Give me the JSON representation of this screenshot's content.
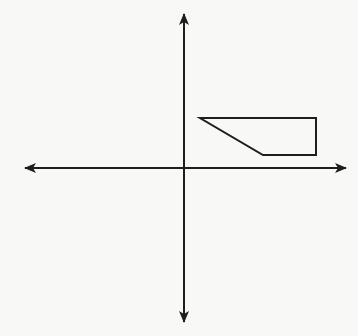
{
  "diagram": {
    "type": "coordinate-plane-with-polygon",
    "colors": {
      "background": "#f8f8f7",
      "stroke": "#1e1e1e"
    },
    "axes": {
      "origin": [
        184,
        168
      ],
      "x_axis": {
        "from": [
          25,
          168
        ],
        "to": [
          346,
          168
        ],
        "arrows": "both"
      },
      "y_axis": {
        "from": [
          184,
          14
        ],
        "to": [
          184,
          322
        ],
        "arrows": "both"
      }
    },
    "polygon": {
      "shape": "trapezoid",
      "quadrant": "I",
      "vertices": [
        [
          200,
          118
        ],
        [
          316,
          118
        ],
        [
          316,
          155
        ],
        [
          263,
          155
        ]
      ]
    }
  }
}
